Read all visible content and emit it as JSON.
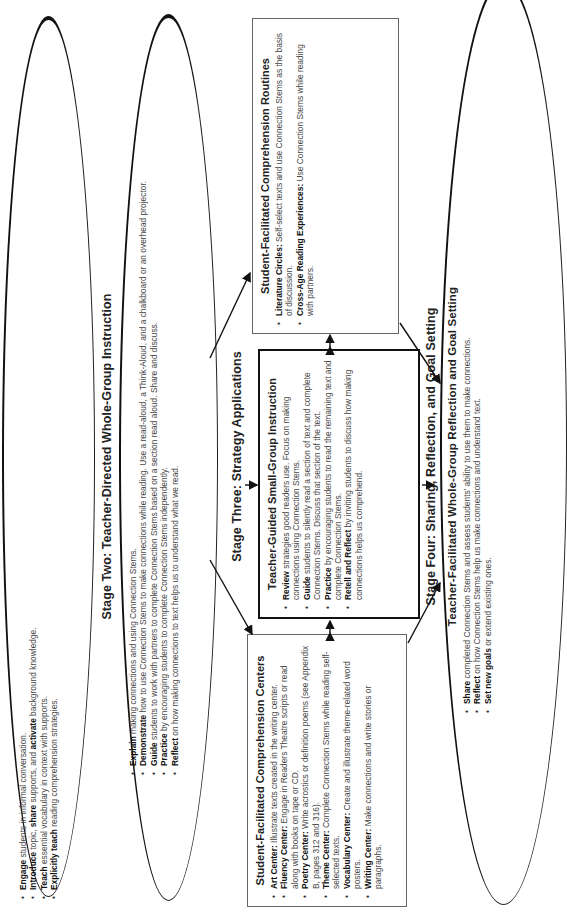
{
  "stage_one": {
    "items": [
      {
        "bold": "Engage",
        "text": " students in informal conversation."
      },
      {
        "bold": "Introduce",
        "text": " topic, ",
        "bold2": "share",
        "text2": " supports, and ",
        "bold3": "activate",
        "text3": " background knowledge."
      },
      {
        "bold": "Teach",
        "text": " essential vocabulary in context with supports."
      },
      {
        "bold": "Explicitly teach",
        "text": " reading comprehension strategies."
      }
    ]
  },
  "stage_two": {
    "title": "Stage Two: Teacher-Directed Whole-Group Instruction",
    "items": [
      {
        "bold": "Explain",
        "text": " making connections and using Connection Stems."
      },
      {
        "bold": "Demonstrate",
        "text": " how to use Connection Stems to make connections while reading. Use a read-aloud, a Think-Aloud, and a chalkboard or an overhead projector."
      },
      {
        "bold": "Guide",
        "text": " students to work with partners to complete Connection Stems based on a section read aloud. Share and discuss."
      },
      {
        "bold": "Practice",
        "text": " by encouraging students to complete Connection Stems independently."
      },
      {
        "bold": "Reflect",
        "text": " on how making connections to text helps us to understand what we read."
      }
    ]
  },
  "stage_three": {
    "title": "Stage Three: Strategy Applications",
    "centers": {
      "title": "Student-Facilitated Comprehension Centers",
      "items": [
        {
          "bold": "Art Center:",
          "text": " Illustrate texts created in the writing center."
        },
        {
          "bold": "Fluency Center:",
          "text": " Engage in Readers Theatre scripts or read along with books on tape or CD."
        },
        {
          "bold": "Poetry Center:",
          "text": " Write acrostics or definition poems (see Appendix B, pages 312 and 316)."
        },
        {
          "bold": "Theme Center:",
          "text": " Complete Connection Stems while reading self-selected texts."
        },
        {
          "bold": "Vocabulary Center:",
          "text": " Create and illustrate theme-related word posters."
        },
        {
          "bold": "Writing Center:",
          "text": " Make connections and write stories or paragraphs."
        }
      ]
    },
    "small_group": {
      "title": "Teacher-Guided Small-Group Instruction",
      "items": [
        {
          "bold": "Review",
          "text": " strategies good readers use. Focus on making connections using Connection Stems."
        },
        {
          "bold": "Guide",
          "text": " students to silently read a section of text and complete Connection Stems. Discuss that section of the text."
        },
        {
          "bold": "Practice",
          "text": " by encouraging students to read the remaining text and complete Connection Stems."
        },
        {
          "bold": "Retell and Reflect",
          "text": " by inviting students to discuss how making connections helps us comprehend."
        }
      ]
    },
    "routines": {
      "title": "Student-Facilitated Comprehension Routines",
      "items": [
        {
          "bold": "Literature Circles:",
          "text": " Self-select texts and use Connection Stems as the basis of discussion."
        },
        {
          "bold": "Cross-Age Reading Experiences:",
          "text": " Use Connection Stems while reading with partners."
        }
      ]
    }
  },
  "stage_four": {
    "title": "Stage Four: Sharing, Reflection, and Goal Setting",
    "subtitle": "Teacher-Facilitated Whole-Group Reflection and Goal Setting",
    "items": [
      {
        "bold": "Share",
        "text": " completed Connection Stems and assess students' ability to use them to make connections."
      },
      {
        "bold": "Reflect",
        "text": " on how Connection Stems help us make connections and understand text."
      },
      {
        "bold": "Set new goals",
        "text": " or extend existing ones."
      }
    ]
  }
}
